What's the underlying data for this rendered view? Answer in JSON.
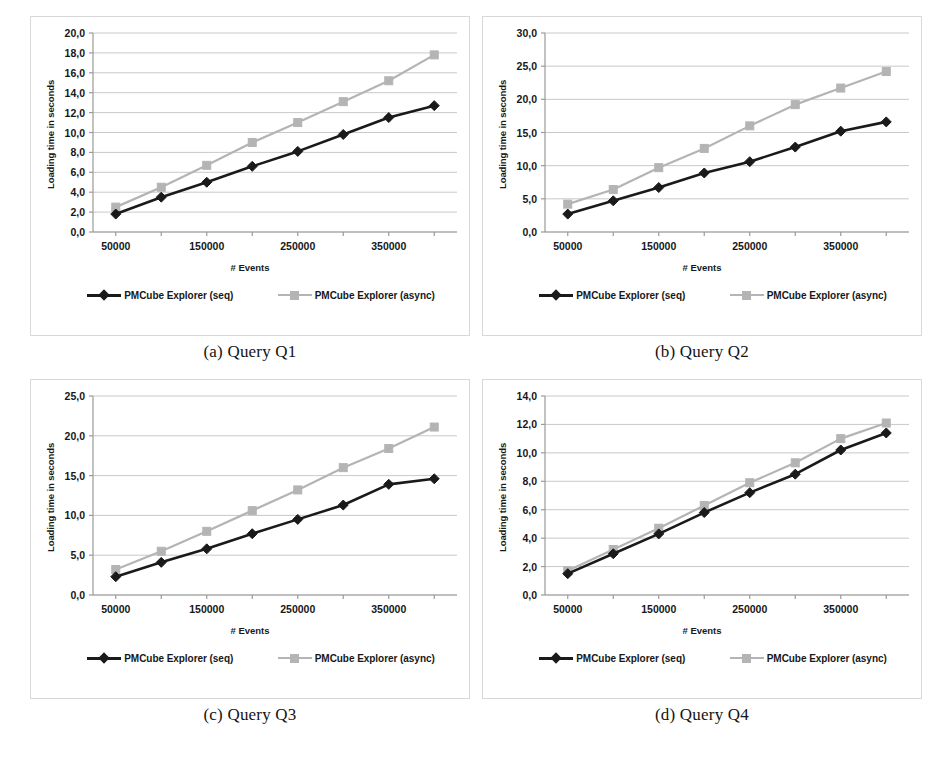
{
  "figure": {
    "series_names": [
      "PMCube Explorer (seq)",
      "PMCube Explorer (async)"
    ],
    "colors": {
      "seq": "#1a1a1a",
      "async": "#b4b4b4",
      "grid": "#c9c9c9",
      "axis": "#9a9a9a",
      "panel_border": "#d8d8d8"
    },
    "axis_titles": {
      "x": "# Events",
      "y": "Loading time in seconds"
    },
    "captions": [
      "(a) Query Q1",
      "(b) Query Q2",
      "(c) Query Q3",
      "(d) Query Q4"
    ]
  },
  "chart_data": [
    {
      "type": "line",
      "title": "(a) Query Q1",
      "xlabel": "# Events",
      "ylabel": "Loading time in seconds",
      "x": [
        50000,
        100000,
        150000,
        200000,
        250000,
        300000,
        350000,
        400000
      ],
      "xtick_labels": [
        "50000",
        "",
        "150000",
        "",
        "250000",
        "",
        "350000",
        ""
      ],
      "ylim": [
        0.0,
        20.0
      ],
      "yticks": [
        0.0,
        2.0,
        4.0,
        6.0,
        8.0,
        10.0,
        12.0,
        14.0,
        16.0,
        18.0,
        20.0
      ],
      "ytick_labels": [
        "0,0",
        "2,0",
        "4,0",
        "6,0",
        "8,0",
        "10,0",
        "12,0",
        "14,0",
        "16,0",
        "18,0",
        "20,0"
      ],
      "grid": true,
      "legend": "bottom",
      "series": [
        {
          "name": "PMCube Explorer (seq)",
          "marker": "diamond",
          "color": "#1a1a1a",
          "values": [
            1.8,
            3.5,
            5.0,
            6.6,
            8.1,
            9.8,
            11.5,
            12.7
          ]
        },
        {
          "name": "PMCube Explorer (async)",
          "marker": "square",
          "color": "#b4b4b4",
          "values": [
            2.5,
            4.5,
            6.7,
            9.0,
            11.0,
            13.1,
            15.2,
            17.8
          ]
        }
      ]
    },
    {
      "type": "line",
      "title": "(b) Query Q2",
      "xlabel": "# Events",
      "ylabel": "Loading time in seconds",
      "x": [
        50000,
        100000,
        150000,
        200000,
        250000,
        300000,
        350000,
        400000
      ],
      "xtick_labels": [
        "50000",
        "",
        "150000",
        "",
        "250000",
        "",
        "350000",
        ""
      ],
      "ylim": [
        0.0,
        30.0
      ],
      "yticks": [
        0.0,
        5.0,
        10.0,
        15.0,
        20.0,
        25.0,
        30.0
      ],
      "ytick_labels": [
        "0,0",
        "5,0",
        "10,0",
        "15,0",
        "20,0",
        "25,0",
        "30,0"
      ],
      "grid": true,
      "legend": "bottom",
      "series": [
        {
          "name": "PMCube Explorer (seq)",
          "marker": "diamond",
          "color": "#1a1a1a",
          "values": [
            2.7,
            4.7,
            6.7,
            8.9,
            10.6,
            12.8,
            15.2,
            16.6
          ]
        },
        {
          "name": "PMCube Explorer (async)",
          "marker": "square",
          "color": "#b4b4b4",
          "values": [
            4.2,
            6.4,
            9.7,
            12.6,
            16.0,
            19.2,
            21.7,
            24.2
          ]
        }
      ]
    },
    {
      "type": "line",
      "title": "(c) Query Q3",
      "xlabel": "# Events",
      "ylabel": "Loading time in seconds",
      "x": [
        50000,
        100000,
        150000,
        200000,
        250000,
        300000,
        350000,
        400000
      ],
      "xtick_labels": [
        "50000",
        "",
        "150000",
        "",
        "250000",
        "",
        "350000",
        ""
      ],
      "ylim": [
        0.0,
        25.0
      ],
      "yticks": [
        0.0,
        5.0,
        10.0,
        15.0,
        20.0,
        25.0
      ],
      "ytick_labels": [
        "0,0",
        "5,0",
        "10,0",
        "15,0",
        "20,0",
        "25,0"
      ],
      "grid": true,
      "legend": "bottom",
      "series": [
        {
          "name": "PMCube Explorer (seq)",
          "marker": "diamond",
          "color": "#1a1a1a",
          "values": [
            2.3,
            4.1,
            5.8,
            7.7,
            9.5,
            11.3,
            13.9,
            14.6
          ]
        },
        {
          "name": "PMCube Explorer (async)",
          "marker": "square",
          "color": "#b4b4b4",
          "values": [
            3.2,
            5.5,
            8.0,
            10.6,
            13.2,
            16.0,
            18.4,
            21.1
          ]
        }
      ]
    },
    {
      "type": "line",
      "title": "(d) Query Q4",
      "xlabel": "# Events",
      "ylabel": "Loading time in seconds",
      "x": [
        50000,
        100000,
        150000,
        200000,
        250000,
        300000,
        350000,
        400000
      ],
      "xtick_labels": [
        "50000",
        "",
        "150000",
        "",
        "250000",
        "",
        "350000",
        ""
      ],
      "ylim": [
        0.0,
        14.0
      ],
      "yticks": [
        0.0,
        2.0,
        4.0,
        6.0,
        8.0,
        10.0,
        12.0,
        14.0
      ],
      "ytick_labels": [
        "0,0",
        "2,0",
        "4,0",
        "6,0",
        "8,0",
        "10,0",
        "12,0",
        "14,0"
      ],
      "grid": true,
      "legend": "bottom",
      "series": [
        {
          "name": "PMCube Explorer (seq)",
          "marker": "diamond",
          "color": "#1a1a1a",
          "values": [
            1.5,
            2.9,
            4.3,
            5.8,
            7.2,
            8.5,
            10.2,
            11.4
          ]
        },
        {
          "name": "PMCube Explorer (async)",
          "marker": "square",
          "color": "#b4b4b4",
          "values": [
            1.7,
            3.2,
            4.7,
            6.3,
            7.9,
            9.3,
            11.0,
            12.1
          ]
        }
      ]
    }
  ]
}
